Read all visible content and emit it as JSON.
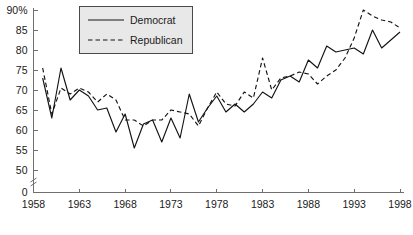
{
  "chart_data": {
    "type": "line",
    "title": "",
    "subtitle": "",
    "xlabel": "",
    "ylabel": "",
    "xlim": [
      1958,
      1998
    ],
    "ylim": [
      50,
      90
    ],
    "y_axis_break": true,
    "y_axis_break_note": "axis broken between 0 and 50",
    "grid": false,
    "legend_position": "top-left",
    "x_tick_labels": [
      "1958",
      "1963",
      "1968",
      "1973",
      "1978",
      "1983",
      "1988",
      "1993",
      "1998"
    ],
    "x_ticks": [
      1958,
      1963,
      1968,
      1973,
      1978,
      1983,
      1988,
      1993,
      1998
    ],
    "y_tick_labels": [
      "90%",
      "85",
      "80",
      "75",
      "70",
      "65",
      "60",
      "55",
      "50",
      "0"
    ],
    "y_ticks": [
      90,
      85,
      80,
      75,
      70,
      65,
      60,
      55,
      50,
      0
    ],
    "x": [
      1959,
      1960,
      1961,
      1962,
      1963,
      1964,
      1965,
      1966,
      1967,
      1968,
      1969,
      1970,
      1971,
      1972,
      1973,
      1974,
      1975,
      1976,
      1977,
      1978,
      1979,
      1980,
      1981,
      1982,
      1983,
      1984,
      1985,
      1986,
      1987,
      1988,
      1989,
      1990,
      1991,
      1992,
      1993,
      1994,
      1995,
      1996,
      1997,
      1998
    ],
    "series": [
      {
        "name": "Democrat",
        "style": "solid",
        "values": [
          73.0,
          63.0,
          75.5,
          67.5,
          70.0,
          68.5,
          65.0,
          65.5,
          59.5,
          64.0,
          55.5,
          61.5,
          62.5,
          57.0,
          63.0,
          58.0,
          69.0,
          62.0,
          65.5,
          68.5,
          64.5,
          66.5,
          64.5,
          66.5,
          69.5,
          68.0,
          72.5,
          73.5,
          72.0,
          77.5,
          75.5,
          81.0,
          79.5,
          80.0,
          80.5,
          79.0,
          85.0,
          80.5,
          82.5,
          84.5
        ],
        "unit": "%"
      },
      {
        "name": "Republican",
        "style": "dashed",
        "values": [
          75.5,
          64.0,
          70.5,
          69.0,
          70.5,
          69.5,
          67.0,
          69.0,
          67.5,
          62.5,
          62.5,
          61.0,
          62.5,
          62.5,
          65.0,
          64.5,
          64.0,
          61.0,
          65.5,
          69.5,
          66.5,
          66.0,
          69.5,
          68.0,
          78.0,
          70.0,
          73.0,
          73.5,
          74.5,
          74.0,
          71.5,
          73.5,
          75.0,
          78.0,
          83.0,
          90.0,
          88.5,
          87.5,
          87.0,
          85.5
        ],
        "unit": "%"
      }
    ]
  },
  "legend": {
    "entries": [
      {
        "label": "Democrat",
        "icon": "solid-line-swatch"
      },
      {
        "label": "Republican",
        "icon": "dashed-line-swatch"
      }
    ]
  }
}
